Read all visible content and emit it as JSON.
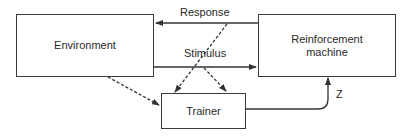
{
  "diagram": {
    "nodes": {
      "environment": {
        "label": "Environment"
      },
      "reinforcement_machine": {
        "label": "Reinforcement machine",
        "line1": "Reinforcement",
        "line2": "machine"
      },
      "trainer": {
        "label": "Trainer"
      }
    },
    "edges": [
      {
        "from": "reinforcement_machine",
        "to": "environment",
        "label": "Response",
        "style": "solid"
      },
      {
        "from": "environment",
        "to": "reinforcement_machine",
        "label": "Stimulus",
        "style": "solid"
      },
      {
        "from": "environment",
        "to": "trainer",
        "label": "",
        "style": "dashed"
      },
      {
        "from": "response",
        "to": "trainer",
        "label": "",
        "style": "dashed"
      },
      {
        "from": "stimulus",
        "to": "trainer",
        "label": "",
        "style": "dashed"
      },
      {
        "from": "trainer",
        "to": "reinforcement_machine",
        "label": "Z",
        "style": "solid"
      }
    ],
    "labels": {
      "response": "Response",
      "stimulus": "Stimulus",
      "z": "Z"
    }
  }
}
